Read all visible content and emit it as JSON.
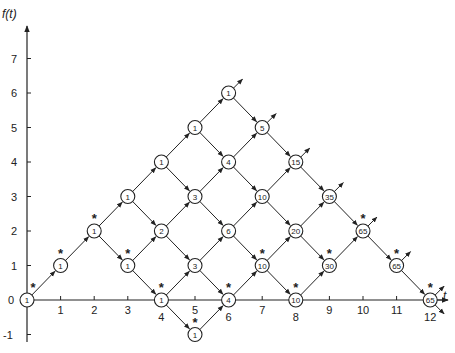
{
  "diagram": {
    "type": "lattice-path-count",
    "y_axis_label": "f(t)",
    "x_axis_label": "t",
    "x_ticks": [
      "1",
      "2",
      "3",
      "4",
      "5",
      "6",
      "7",
      "8",
      "9",
      "10",
      "11",
      "12"
    ],
    "y_ticks": [
      "7",
      "6",
      "5",
      "4",
      "3",
      "2",
      "1",
      "0",
      "-1"
    ],
    "colors": {
      "ink": "#222222",
      "background": "#ffffff"
    },
    "nodes": [
      {
        "t": 0,
        "y": 0,
        "value": "1",
        "star": true,
        "out": false
      },
      {
        "t": 1,
        "y": 1,
        "value": "1",
        "star": true,
        "out": false
      },
      {
        "t": 2,
        "y": 2,
        "value": "1",
        "star": true,
        "out": false
      },
      {
        "t": 3,
        "y": 3,
        "value": "1",
        "star": false,
        "out": false
      },
      {
        "t": 3,
        "y": 1,
        "value": "1",
        "star": true,
        "out": false
      },
      {
        "t": 4,
        "y": 4,
        "value": "1",
        "star": false,
        "out": false
      },
      {
        "t": 4,
        "y": 2,
        "value": "2",
        "star": false,
        "out": false
      },
      {
        "t": 4,
        "y": 0,
        "value": "1",
        "star": true,
        "out": false
      },
      {
        "t": 5,
        "y": 5,
        "value": "1",
        "star": false,
        "out": false
      },
      {
        "t": 5,
        "y": 3,
        "value": "3",
        "star": false,
        "out": false
      },
      {
        "t": 5,
        "y": 1,
        "value": "3",
        "star": false,
        "out": false
      },
      {
        "t": 5,
        "y": -1,
        "value": "1",
        "star": true,
        "out": false
      },
      {
        "t": 6,
        "y": 6,
        "value": "1",
        "star": false,
        "out": true
      },
      {
        "t": 6,
        "y": 4,
        "value": "4",
        "star": false,
        "out": false
      },
      {
        "t": 6,
        "y": 2,
        "value": "6",
        "star": false,
        "out": false
      },
      {
        "t": 6,
        "y": 0,
        "value": "4",
        "star": true,
        "out": false
      },
      {
        "t": 7,
        "y": 5,
        "value": "5",
        "star": false,
        "out": true
      },
      {
        "t": 7,
        "y": 3,
        "value": "10",
        "star": false,
        "out": false
      },
      {
        "t": 7,
        "y": 1,
        "value": "10",
        "star": true,
        "out": false
      },
      {
        "t": 8,
        "y": 4,
        "value": "15",
        "star": false,
        "out": true
      },
      {
        "t": 8,
        "y": 2,
        "value": "20",
        "star": false,
        "out": false
      },
      {
        "t": 8,
        "y": 0,
        "value": "10",
        "star": true,
        "out": false
      },
      {
        "t": 9,
        "y": 3,
        "value": "35",
        "star": false,
        "out": true
      },
      {
        "t": 9,
        "y": 1,
        "value": "30",
        "star": true,
        "out": false
      },
      {
        "t": 10,
        "y": 2,
        "value": "65",
        "star": true,
        "out": true
      },
      {
        "t": 11,
        "y": 1,
        "value": "65",
        "star": true,
        "out": true
      },
      {
        "t": 12,
        "y": 0,
        "value": "65",
        "star": true,
        "out": true
      }
    ]
  }
}
